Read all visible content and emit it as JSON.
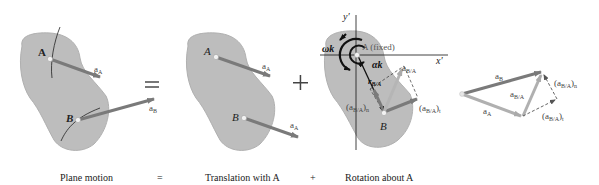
{
  "colors": {
    "body_fill": "#bdbdbd",
    "body_stroke": "#a9a9a9",
    "vector_dark": "#7a7a7a",
    "vector_light": "#aaaaaa",
    "line": "#111111",
    "text": "#222222",
    "subscript_text": "#555555"
  },
  "panels": {
    "plane_motion": {
      "point_A": "A",
      "point_B": "B",
      "vector_aA": "a",
      "vector_aA_sub": "A",
      "vector_aB": "a",
      "vector_aB_sub": "B"
    },
    "equals_symbol": "=",
    "translation": {
      "point_A": "A",
      "point_B": "B",
      "vector_aA_1": "a",
      "vector_aA_1_sub": "A",
      "vector_aA_2": "a",
      "vector_aA_2_sub": "A"
    },
    "plus_symbol": "+",
    "rotation": {
      "axis_y": "y′",
      "axis_x": "x′",
      "fixed_label": "A (fixed)",
      "omega_label": "ωk",
      "alpha_label": "αk",
      "r_label": "r",
      "r_sub": "B/A",
      "aBA_label": "a",
      "aBA_sub": "B/A",
      "aBA_n_label": "(a",
      "aBA_n_sub": "B/A",
      "aBA_n_tail": ")",
      "aBA_n_idx": "n",
      "aBA_t_label": "(a",
      "aBA_t_sub": "B/A",
      "aBA_t_tail": ")",
      "aBA_t_idx": "t",
      "point_B": "B"
    },
    "vector_polygon": {
      "aB": "a",
      "aB_sub": "B",
      "aA": "a",
      "aA_sub": "A",
      "aBA": "a",
      "aBA_sub": "B/A",
      "aBA_n": "(a",
      "aBA_n_sub": "B/A",
      "aBA_n_tail": ")",
      "aBA_n_idx": "n",
      "aBA_t": "(a",
      "aBA_t_sub": "B/A",
      "aBA_t_tail": ")",
      "aBA_t_idx": "t"
    }
  },
  "captions": {
    "plane_motion": "Plane motion",
    "equals": "=",
    "translation": "Translation with A",
    "plus": "+",
    "rotation": "Rotation about A"
  }
}
